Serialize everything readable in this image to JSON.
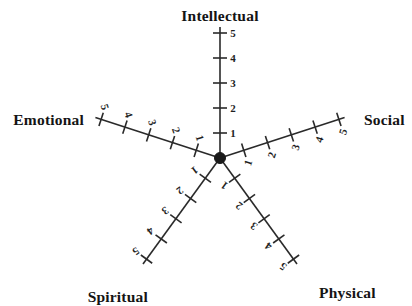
{
  "figure": {
    "type": "radar-scale-diagram",
    "background_color": "#ffffff",
    "line_color": "#2a2a2a",
    "text_color": "#141414",
    "center_point": {
      "x": 220,
      "y": 158,
      "radius": 5.5
    }
  },
  "axes": [
    {
      "id": "intellectual",
      "label": "Intellectual",
      "angle_deg": 90,
      "label_x": 220,
      "label_y": 15,
      "label_anchor": "middle",
      "label_rotation": 0,
      "tick_label_rotation": 0,
      "tick_label_side": "right",
      "ticks": [
        {
          "value": "1",
          "r": 25
        },
        {
          "value": "2",
          "r": 50
        },
        {
          "value": "3",
          "r": 75
        },
        {
          "value": "4",
          "r": 100
        },
        {
          "value": "5",
          "r": 125
        }
      ]
    },
    {
      "id": "social",
      "label": "Social",
      "angle_deg": 18,
      "label_x": 364,
      "label_y": 119,
      "label_anchor": "start",
      "label_rotation": 0,
      "tick_label_rotation": -72,
      "tick_label_side": "right",
      "ticks": [
        {
          "value": "1",
          "r": 25
        },
        {
          "value": "2",
          "r": 50
        },
        {
          "value": "3",
          "r": 75
        },
        {
          "value": "4",
          "r": 100
        },
        {
          "value": "5",
          "r": 125
        }
      ]
    },
    {
      "id": "physical",
      "label": "Physical",
      "angle_deg": -54,
      "label_x": 319,
      "label_y": 292,
      "label_anchor": "start",
      "label_rotation": 0,
      "tick_label_rotation": -144,
      "tick_label_side": "right",
      "ticks": [
        {
          "value": "1",
          "r": 25
        },
        {
          "value": "2",
          "r": 50
        },
        {
          "value": "3",
          "r": 75
        },
        {
          "value": "4",
          "r": 100
        },
        {
          "value": "5",
          "r": 125
        }
      ]
    },
    {
      "id": "spiritual",
      "label": "Spiritual",
      "angle_deg": 234,
      "label_x": 148,
      "label_y": 296,
      "label_anchor": "end",
      "label_rotation": 0,
      "tick_label_rotation": 144,
      "tick_label_side": "right",
      "ticks": [
        {
          "value": "1",
          "r": 25
        },
        {
          "value": "2",
          "r": 50
        },
        {
          "value": "3",
          "r": 75
        },
        {
          "value": "4",
          "r": 100
        },
        {
          "value": "5",
          "r": 125
        }
      ]
    },
    {
      "id": "emotional",
      "label": "Emotional",
      "angle_deg": 162,
      "label_x": 84,
      "label_y": 119,
      "label_anchor": "end",
      "label_rotation": 0,
      "tick_label_rotation": 72,
      "tick_label_side": "right",
      "ticks": [
        {
          "value": "1",
          "r": 25
        },
        {
          "value": "2",
          "r": 50
        },
        {
          "value": "3",
          "r": 75
        },
        {
          "value": "4",
          "r": 100
        },
        {
          "value": "5",
          "r": 125
        }
      ]
    }
  ],
  "chart_data": {
    "type": "radar",
    "title": "",
    "subtitle": "",
    "xlabel": "",
    "ylabel": "",
    "grid": false,
    "legend": "none",
    "categories": [
      "Intellectual",
      "Social",
      "Physical",
      "Spiritual",
      "Emotional"
    ],
    "axis_range": [
      0,
      5
    ],
    "tick_labels": [
      "1",
      "2",
      "3",
      "4",
      "5"
    ],
    "tick_count": 5,
    "series": [],
    "annotations": []
  }
}
